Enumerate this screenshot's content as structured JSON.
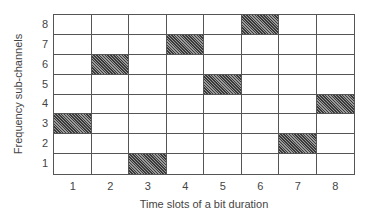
{
  "chart_data": {
    "type": "table",
    "title": "",
    "xlabel": "Time slots of a bit duration",
    "ylabel": "Frequency sub-channels",
    "x_ticks": [
      "1",
      "2",
      "3",
      "4",
      "5",
      "6",
      "7",
      "8"
    ],
    "y_ticks": [
      "1",
      "2",
      "3",
      "4",
      "5",
      "6",
      "7",
      "8"
    ],
    "grid": {
      "columns": 8,
      "rows": 8
    },
    "filled_cells": [
      {
        "time_slot": 1,
        "sub_channel": 3
      },
      {
        "time_slot": 2,
        "sub_channel": 6
      },
      {
        "time_slot": 3,
        "sub_channel": 1
      },
      {
        "time_slot": 4,
        "sub_channel": 7
      },
      {
        "time_slot": 5,
        "sub_channel": 5
      },
      {
        "time_slot": 6,
        "sub_channel": 8
      },
      {
        "time_slot": 7,
        "sub_channel": 2
      },
      {
        "time_slot": 8,
        "sub_channel": 4
      }
    ],
    "hop_sequence": [
      3,
      6,
      1,
      7,
      5,
      8,
      2,
      4
    ],
    "fill_style": "hatched dark gray"
  },
  "labels": {
    "xlabel": "Time slots of a bit duration",
    "ylabel": "Frequency sub-channels"
  }
}
